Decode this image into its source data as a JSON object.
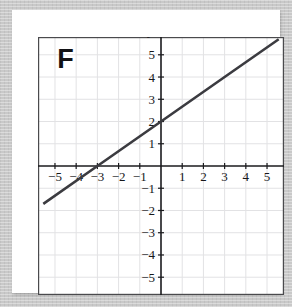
{
  "figure": {
    "letter_label": "F",
    "x_axis_name": "x",
    "y_axis_name": "y"
  },
  "colors": {
    "outer_background": "#c9c9c9",
    "card_background": "#ffffff",
    "grid_line": "#e2e2e4",
    "frame_border": "#4a4a4d",
    "axis": "#1b1b1e",
    "plotted_line": "#3b3b40",
    "tick_text": "#17171a"
  },
  "chart_data": {
    "type": "line",
    "title": "",
    "subtitle": "",
    "xlabel": "x",
    "ylabel": "y",
    "xlim": [
      -5.8,
      5.8
    ],
    "ylim": [
      -5.8,
      5.8
    ],
    "grid": true,
    "grid_step": 1,
    "legend": null,
    "legend_position": "none",
    "annotations": [
      {
        "text": "F",
        "x": -4.5,
        "y": 4.4
      }
    ],
    "x_ticks": [
      -5,
      -4,
      -3,
      -2,
      -1,
      1,
      2,
      3,
      4,
      5
    ],
    "y_ticks": [
      -5,
      -4,
      -3,
      -2,
      -1,
      1,
      2,
      3,
      4,
      5
    ],
    "x_tick_labels": [
      "−5",
      "−4",
      "−3",
      "−2",
      "−1",
      "1",
      "2",
      "3",
      "4",
      "5"
    ],
    "y_tick_labels": [
      "−5",
      "−4",
      "−3",
      "−2",
      "−1",
      "1",
      "2",
      "3",
      "4",
      "5"
    ],
    "series": [
      {
        "name": "line",
        "equation": "y = (2/3)x + 2",
        "slope": 0.6667,
        "intercept": 2,
        "x_intercept": -3,
        "y_intercept": 2,
        "points": [
          {
            "x": -5.5,
            "y": -1.667
          },
          {
            "x": -3,
            "y": 0
          },
          {
            "x": 0,
            "y": 2
          },
          {
            "x": 3,
            "y": 4
          },
          {
            "x": 5.5,
            "y": 5.667
          }
        ]
      }
    ]
  }
}
